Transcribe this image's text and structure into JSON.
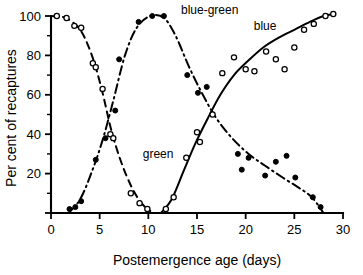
{
  "chart_data": {
    "type": "line",
    "title": "",
    "xlabel": "Postemergence age (days)",
    "ylabel": "Per cent of recaptures",
    "xlim": [
      0,
      30
    ],
    "ylim": [
      0,
      100
    ],
    "xticks": [
      0,
      5,
      10,
      15,
      20,
      25,
      30
    ],
    "xtick_labels": [
      "0",
      "5",
      "10",
      "15",
      "20",
      "25",
      "30"
    ],
    "yticks": [
      0,
      20,
      40,
      60,
      80,
      100
    ],
    "ytick_labels": [
      "",
      "20",
      "40",
      "60",
      "80",
      "100"
    ],
    "x_minor_step": 1,
    "y_minor_step": 10,
    "grid": false,
    "legend_position": "inline-annotations",
    "series": [
      {
        "name": "green",
        "label": "green",
        "label_x": 11.0,
        "label_y": 28,
        "marker": "open-circle",
        "line_style": "dashed",
        "points": [
          {
            "x": 0.6,
            "y": 100
          },
          {
            "x": 1.6,
            "y": 99
          },
          {
            "x": 2.4,
            "y": 95
          },
          {
            "x": 3.1,
            "y": 94
          },
          {
            "x": 4.3,
            "y": 76
          },
          {
            "x": 4.6,
            "y": 74
          },
          {
            "x": 5.3,
            "y": 63
          },
          {
            "x": 6.1,
            "y": 40
          },
          {
            "x": 6.4,
            "y": 38
          },
          {
            "x": 8.2,
            "y": 10
          },
          {
            "x": 9.1,
            "y": 5
          },
          {
            "x": 9.9,
            "y": 2
          }
        ],
        "curve": [
          {
            "x": 0.0,
            "y": 100
          },
          {
            "x": 1.5,
            "y": 99
          },
          {
            "x": 3.0,
            "y": 93
          },
          {
            "x": 4.2,
            "y": 80
          },
          {
            "x": 5.2,
            "y": 63
          },
          {
            "x": 6.2,
            "y": 42
          },
          {
            "x": 7.2,
            "y": 26
          },
          {
            "x": 8.3,
            "y": 13
          },
          {
            "x": 9.3,
            "y": 5
          },
          {
            "x": 10.2,
            "y": 1
          }
        ]
      },
      {
        "name": "blue-green",
        "label": "blue-green",
        "label_x": 16.3,
        "label_y": 101,
        "marker": "filled-circle",
        "line_style": "dash-dot",
        "points": [
          {
            "x": 1.9,
            "y": 2
          },
          {
            "x": 2.5,
            "y": 3
          },
          {
            "x": 3.1,
            "y": 6
          },
          {
            "x": 4.6,
            "y": 27
          },
          {
            "x": 5.6,
            "y": 38
          },
          {
            "x": 6.6,
            "y": 52
          },
          {
            "x": 7.0,
            "y": 78
          },
          {
            "x": 9.0,
            "y": 97
          },
          {
            "x": 10.4,
            "y": 100
          },
          {
            "x": 11.6,
            "y": 100
          },
          {
            "x": 14.0,
            "y": 70
          },
          {
            "x": 15.1,
            "y": 61
          },
          {
            "x": 16.0,
            "y": 64
          },
          {
            "x": 19.2,
            "y": 30
          },
          {
            "x": 19.6,
            "y": 22
          },
          {
            "x": 20.3,
            "y": 28
          },
          {
            "x": 22.0,
            "y": 19
          },
          {
            "x": 23.1,
            "y": 26
          },
          {
            "x": 24.2,
            "y": 29
          },
          {
            "x": 25.1,
            "y": 18
          },
          {
            "x": 26.9,
            "y": 8
          },
          {
            "x": 27.7,
            "y": 3
          }
        ],
        "curve": [
          {
            "x": 1.8,
            "y": 0
          },
          {
            "x": 3.0,
            "y": 7
          },
          {
            "x": 4.2,
            "y": 21
          },
          {
            "x": 5.3,
            "y": 37
          },
          {
            "x": 6.4,
            "y": 57
          },
          {
            "x": 7.6,
            "y": 80
          },
          {
            "x": 8.8,
            "y": 94
          },
          {
            "x": 10.2,
            "y": 100
          },
          {
            "x": 11.6,
            "y": 99
          },
          {
            "x": 12.8,
            "y": 90
          },
          {
            "x": 14.2,
            "y": 74
          },
          {
            "x": 15.6,
            "y": 60
          },
          {
            "x": 17.0,
            "y": 48
          },
          {
            "x": 18.6,
            "y": 38
          },
          {
            "x": 20.3,
            "y": 30
          },
          {
            "x": 22.0,
            "y": 24
          },
          {
            "x": 23.8,
            "y": 18
          },
          {
            "x": 25.4,
            "y": 13
          },
          {
            "x": 26.8,
            "y": 8
          },
          {
            "x": 28.0,
            "y": 0
          }
        ]
      },
      {
        "name": "blue",
        "label": "blue",
        "label_x": 22.0,
        "label_y": 93,
        "marker": "open-circle",
        "line_style": "solid",
        "points": [
          {
            "x": 11.8,
            "y": 2
          },
          {
            "x": 12.6,
            "y": 8
          },
          {
            "x": 13.9,
            "y": 28
          },
          {
            "x": 15.0,
            "y": 41
          },
          {
            "x": 15.3,
            "y": 36
          },
          {
            "x": 16.6,
            "y": 50
          },
          {
            "x": 17.6,
            "y": 71
          },
          {
            "x": 18.8,
            "y": 79
          },
          {
            "x": 20.0,
            "y": 73
          },
          {
            "x": 20.9,
            "y": 72
          },
          {
            "x": 22.1,
            "y": 82
          },
          {
            "x": 23.1,
            "y": 78
          },
          {
            "x": 24.0,
            "y": 73
          },
          {
            "x": 25.0,
            "y": 84
          },
          {
            "x": 26.0,
            "y": 93
          },
          {
            "x": 27.0,
            "y": 96
          },
          {
            "x": 28.2,
            "y": 100
          },
          {
            "x": 29.0,
            "y": 101
          }
        ],
        "curve": [
          {
            "x": 11.3,
            "y": 0
          },
          {
            "x": 12.4,
            "y": 7
          },
          {
            "x": 13.6,
            "y": 21
          },
          {
            "x": 14.8,
            "y": 35
          },
          {
            "x": 16.1,
            "y": 48
          },
          {
            "x": 17.4,
            "y": 60
          },
          {
            "x": 18.8,
            "y": 70
          },
          {
            "x": 20.2,
            "y": 77
          },
          {
            "x": 21.8,
            "y": 84
          },
          {
            "x": 23.4,
            "y": 89
          },
          {
            "x": 25.0,
            "y": 93
          },
          {
            "x": 26.6,
            "y": 97
          },
          {
            "x": 28.0,
            "y": 100
          },
          {
            "x": 29.2,
            "y": 101
          }
        ]
      }
    ]
  },
  "axes": {
    "x_title": "Postemergence age (days)",
    "y_title": "Per cent of recaptures",
    "x_tick_labels": [
      "0",
      "5",
      "10",
      "15",
      "20",
      "25",
      "30"
    ],
    "y_tick_labels": [
      "20",
      "40",
      "60",
      "80",
      "100"
    ]
  },
  "labels": {
    "green": "green",
    "blue_green": "blue-green",
    "blue": "blue"
  },
  "colors": {
    "ink": "#000000",
    "background": "#ffffff"
  }
}
